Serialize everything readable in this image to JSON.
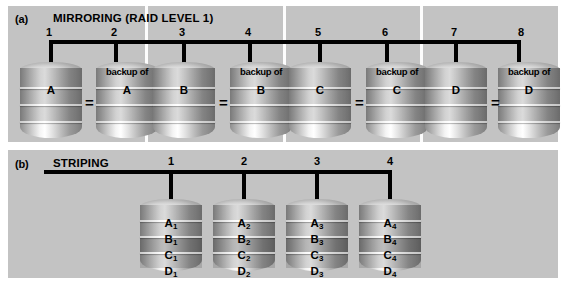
{
  "diagram": {
    "background": "#ffffff",
    "panel_color": "#c3c3c3",
    "line_color": "#000000"
  },
  "panel_a": {
    "tag": "(a)",
    "title": "MIRRORING (RAID LEVEL 1)",
    "disk_numbers": [
      "1",
      "2",
      "3",
      "4",
      "5",
      "6",
      "7",
      "8"
    ],
    "equals_symbol": "=",
    "backup_caption": "backup of",
    "pairs": [
      {
        "primary_label": "A",
        "backup_label": "A",
        "primary_number": "1",
        "backup_number": "2"
      },
      {
        "primary_label": "B",
        "backup_label": "B",
        "primary_number": "3",
        "backup_number": "4"
      },
      {
        "primary_label": "C",
        "backup_label": "C",
        "primary_number": "5",
        "backup_number": "6"
      },
      {
        "primary_label": "D",
        "backup_label": "D",
        "primary_number": "7",
        "backup_number": "8"
      }
    ]
  },
  "panel_b": {
    "tag": "(b)",
    "title": "STRIPING",
    "disk_numbers": [
      "1",
      "2",
      "3",
      "4"
    ],
    "disks": [
      {
        "number": "1",
        "stripes": [
          "A",
          "B",
          "C",
          "D"
        ],
        "index": "1"
      },
      {
        "number": "2",
        "stripes": [
          "A",
          "B",
          "C",
          "D"
        ],
        "index": "2"
      },
      {
        "number": "3",
        "stripes": [
          "A",
          "B",
          "C",
          "D"
        ],
        "index": "3"
      },
      {
        "number": "4",
        "stripes": [
          "A",
          "B",
          "C",
          "D"
        ],
        "index": "4"
      }
    ]
  }
}
